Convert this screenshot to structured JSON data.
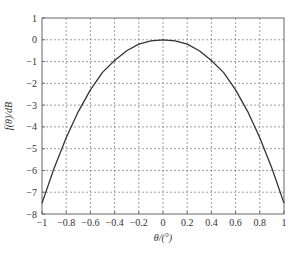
{
  "chart_data": {
    "type": "line",
    "title": "",
    "xlabel": "θ/(°)",
    "ylabel": "f(θ)/dB",
    "xlim": [
      -1,
      1
    ],
    "ylim": [
      -8,
      1
    ],
    "grid": true,
    "legend": null,
    "x_ticks": [
      "-1",
      "-0.8",
      "-0.6",
      "-0.4",
      "-0.2",
      "0",
      "0.2",
      "0.4",
      "0.6",
      "0.8",
      "1"
    ],
    "y_ticks": [
      "1",
      "0",
      "-1",
      "-2",
      "-3",
      "-4",
      "-5",
      "-6",
      "-7",
      "-8"
    ],
    "series": [
      {
        "name": "f(θ)",
        "color": "#333333",
        "x": [
          -1,
          -0.9,
          -0.8,
          -0.7,
          -0.6,
          -0.5,
          -0.4,
          -0.3,
          -0.2,
          -0.1,
          0,
          0.1,
          0.2,
          0.3,
          0.4,
          0.5,
          0.6,
          0.7,
          0.8,
          0.9,
          1
        ],
        "y": [
          -7.5,
          -5.9,
          -4.5,
          -3.3,
          -2.3,
          -1.5,
          -0.95,
          -0.5,
          -0.2,
          -0.05,
          0,
          -0.05,
          -0.2,
          -0.5,
          -0.95,
          -1.5,
          -2.3,
          -3.3,
          -4.5,
          -5.9,
          -7.5
        ]
      }
    ]
  }
}
